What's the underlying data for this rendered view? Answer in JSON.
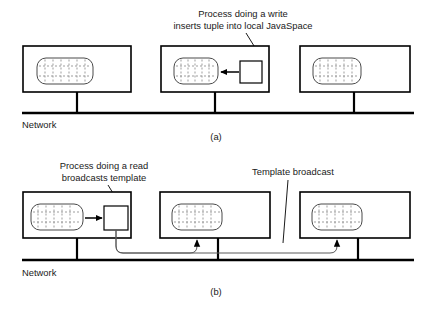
{
  "figure": {
    "panels": [
      {
        "id": "a",
        "caption": "(a)",
        "network_label": "Network",
        "annotation": {
          "line1": "Process doing a write",
          "line2": "inserts tuple into local JavaSpace"
        },
        "machines": [
          {
            "name": "machine-left",
            "has_process": false
          },
          {
            "name": "machine-middle",
            "has_process": true
          },
          {
            "name": "machine-right",
            "has_process": false
          }
        ]
      },
      {
        "id": "b",
        "caption": "(b)",
        "network_label": "Network",
        "annotation": {
          "line1": "Process doing a read",
          "line2": "broadcasts template"
        },
        "broadcast_label": "Template broadcast",
        "machines": [
          {
            "name": "machine-left",
            "has_process": true
          },
          {
            "name": "machine-middle",
            "has_process": false
          },
          {
            "name": "machine-right",
            "has_process": false
          }
        ]
      }
    ],
    "colors": {
      "ink": "#1a1a1a",
      "outline": "#000000",
      "tuple_outline": "#4a4a4a",
      "tuple_grid": "#8d8d8d",
      "broadcast": "#5a5a5a",
      "background": "#ffffff"
    }
  }
}
